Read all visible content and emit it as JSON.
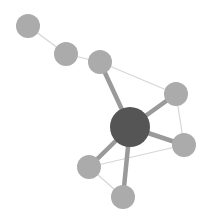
{
  "diagram": {
    "type": "network-graph",
    "colors": {
      "background": "#ffffff",
      "hub": "#555555",
      "node": "#ababab",
      "thick_edge": "#9a9a9a",
      "thin_edge": "#d6d6d6"
    },
    "nodes": [
      {
        "id": "n1",
        "x": 28,
        "y": 26,
        "r": 12,
        "role": "leaf"
      },
      {
        "id": "n2",
        "x": 66,
        "y": 54,
        "r": 12,
        "role": "leaf"
      },
      {
        "id": "n3",
        "x": 100,
        "y": 62,
        "r": 12,
        "role": "leaf"
      },
      {
        "id": "hub",
        "x": 130,
        "y": 127,
        "r": 20,
        "role": "hub"
      },
      {
        "id": "n4",
        "x": 176,
        "y": 94,
        "r": 12,
        "role": "leaf"
      },
      {
        "id": "n5",
        "x": 184,
        "y": 145,
        "r": 12,
        "role": "leaf"
      },
      {
        "id": "n6",
        "x": 89,
        "y": 167,
        "r": 12,
        "role": "leaf"
      },
      {
        "id": "n7",
        "x": 123,
        "y": 197,
        "r": 12,
        "role": "leaf"
      }
    ],
    "edges": [
      {
        "from": "n1",
        "to": "n2",
        "weight": "thin"
      },
      {
        "from": "n2",
        "to": "n3",
        "weight": "thin"
      },
      {
        "from": "n3",
        "to": "n4",
        "weight": "thin"
      },
      {
        "from": "n4",
        "to": "n5",
        "weight": "thin"
      },
      {
        "from": "n5",
        "to": "n6",
        "weight": "thin"
      },
      {
        "from": "n6",
        "to": "n7",
        "weight": "thin"
      },
      {
        "from": "hub",
        "to": "n3",
        "weight": "thick"
      },
      {
        "from": "hub",
        "to": "n4",
        "weight": "thick"
      },
      {
        "from": "hub",
        "to": "n5",
        "weight": "thick"
      },
      {
        "from": "hub",
        "to": "n6",
        "weight": "thick"
      },
      {
        "from": "hub",
        "to": "n7",
        "weight": "thick"
      }
    ]
  }
}
